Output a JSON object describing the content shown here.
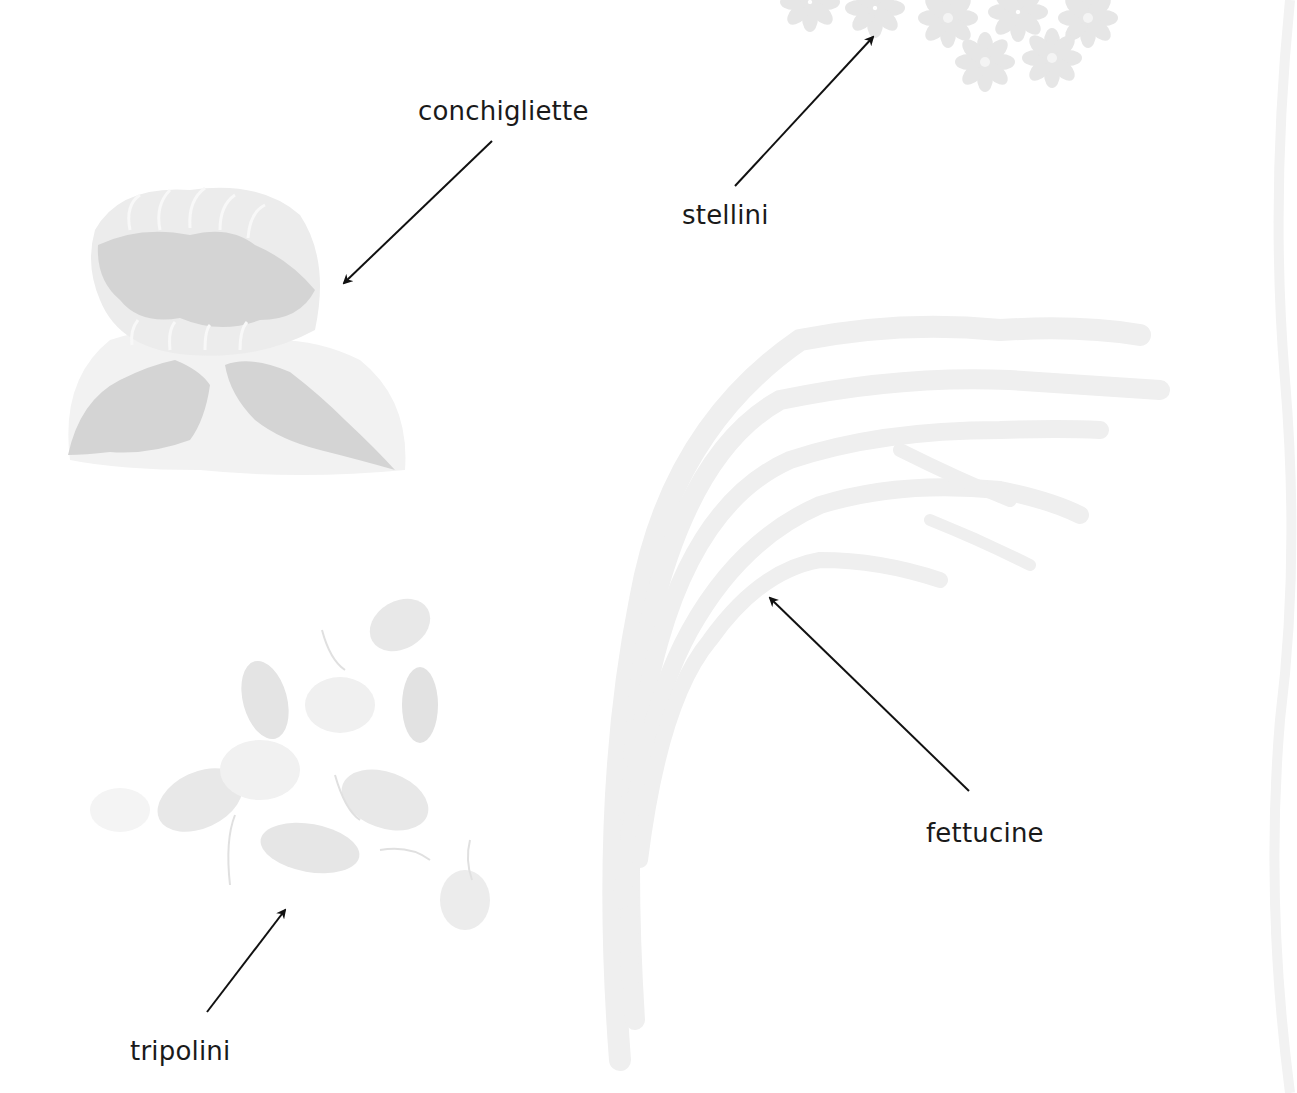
{
  "diagram": {
    "type": "labeled-illustration",
    "labels": [
      {
        "id": "conchigliette",
        "text": "conchigliette",
        "x": 418,
        "y": 98
      },
      {
        "id": "stellini",
        "text": "stellini",
        "x": 682,
        "y": 202
      },
      {
        "id": "fettucine",
        "text": "fettucine",
        "x": 926,
        "y": 820
      },
      {
        "id": "tripolini",
        "text": "tripolini",
        "x": 130,
        "y": 1038
      }
    ],
    "arrows": [
      {
        "from_label": "conchigliette",
        "x1": 492,
        "y1": 141,
        "x2": 344,
        "y2": 283
      },
      {
        "from_label": "stellini",
        "x1": 735,
        "y1": 186,
        "x2": 873,
        "y2": 37
      },
      {
        "from_label": "fettucine",
        "x1": 969,
        "y1": 791,
        "x2": 770,
        "y2": 598
      },
      {
        "from_label": "tripolini",
        "x1": 207,
        "y1": 1012,
        "x2": 285,
        "y2": 910
      }
    ],
    "colors": {
      "background": "#ffffff",
      "label_text": "#1a1a1a",
      "arrow": "#111111",
      "pasta_dark": "#d2d2d2",
      "pasta_mid": "#e4e4e4",
      "pasta_light": "#f0f0f0"
    }
  }
}
